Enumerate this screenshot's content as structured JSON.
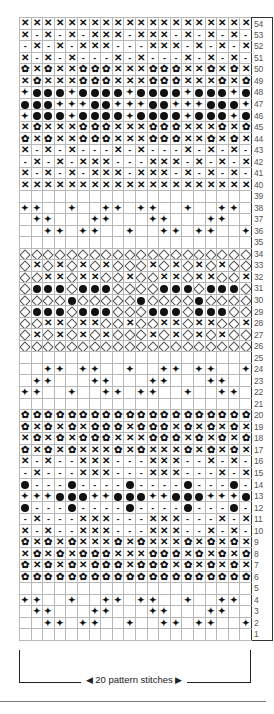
{
  "chart": {
    "columns": 20,
    "rows_count": 54,
    "legend_map": {
      "X": "cross",
      "-": "dash",
      "f": "flower",
      "d": "dot",
      "p": "diamond-star",
      "o": "open-diamond",
      " ": "blank"
    },
    "rows": [
      {
        "n": "54",
        "cells": "XXXXXXXXXXXXXXXXXXXX"
      },
      {
        "n": "53",
        "cells": "X-X-X-XXX-XXX-X-X-X-"
      },
      {
        "n": "52",
        "cells": "-X-X-XXX---XXX-X-X-X"
      },
      {
        "n": "51",
        "cells": "X-X-X---X-X---X-X-X-"
      },
      {
        "n": "50",
        "cells": "fXfXXfffXXXfffXXfXfX"
      },
      {
        "n": "49",
        "cells": "XfXXXfffXXXfffXXXfXf"
      },
      {
        "n": "48",
        "cells": "pdddpddddpddddpdddpd"
      },
      {
        "n": "47",
        "cells": "dddpppddpppddpppdddp"
      },
      {
        "n": "46",
        "cells": "pdddpddddpddddpdddpd"
      },
      {
        "n": "45",
        "cells": "XfXXXfffXXXfffXXXfXf"
      },
      {
        "n": "44",
        "cells": "fXfXXfffXXXfffXXfXfX"
      },
      {
        "n": "43",
        "cells": "X-X-X---X-X---X-X-X-"
      },
      {
        "n": "42",
        "cells": "-X-X-XXX---XXX-X-X-X"
      },
      {
        "n": "41",
        "cells": "X-X-X-XXX-XXX-X-X-X-"
      },
      {
        "n": "40",
        "cells": "XXXXXXXXXXXXXXXXXXXX"
      },
      {
        "n": "39",
        "cells": "                    "
      },
      {
        "n": "38",
        "cells": "pp  p  pp pp  p  pp "
      },
      {
        "n": "37",
        "cells": " pp   pp   pp   pp  "
      },
      {
        "n": "36",
        "cells": "  pp pp  p  pp pp  p"
      },
      {
        "n": "35",
        "cells": "                    "
      },
      {
        "n": "34",
        "cells": "oooooooooooooooooooo"
      },
      {
        "n": "33",
        "cells": "oXoXoXoXoooXoXoXoXoo"
      },
      {
        "n": "32",
        "cells": "ooXXoXXooXooXXoXXooX"
      },
      {
        "n": "31",
        "cells": "odddodddoooodddoddd oo"
      },
      {
        "n": "30",
        "cells": "oooodooooodoooodooood"
      },
      {
        "n": "29",
        "cells": "odddodddooodddodddoo"
      },
      {
        "n": "28",
        "cells": "ooXXoXXooXooXXoXXooX"
      },
      {
        "n": "27",
        "cells": "oXoXoXoXoooXoXoXoXoo"
      },
      {
        "n": "26",
        "cells": "oooooooooooooooooooo"
      },
      {
        "n": "25",
        "cells": "                    "
      },
      {
        "n": "24",
        "cells": "  pp pp  p  pp pp  p"
      },
      {
        "n": "23",
        "cells": " pp   pp   pp   pp  "
      },
      {
        "n": "22",
        "cells": "pp  p  pp pp  p  pp "
      },
      {
        "n": "21",
        "cells": "                    "
      },
      {
        "n": "20",
        "cells": "ffffffffffffffffffff"
      },
      {
        "n": "19",
        "cells": "fXfXfXfffXfffXfXfXfX"
      },
      {
        "n": "18",
        "cells": "XfXfXfffXXXfffXfXfXf"
      },
      {
        "n": "17",
        "cells": "fXfXfXXXfXfXXXfXfXfX"
      },
      {
        "n": "16",
        "cells": "X-X--XXX---XXX--X-X-"
      },
      {
        "n": "15",
        "cells": "-X---XXX---XXX---X-X"
      },
      {
        "n": "14",
        "cells": "d---d----d----d---d-"
      },
      {
        "n": "13",
        "cells": "pppdddppdddppdddpppd"
      },
      {
        "n": "12",
        "cells": "d---d----d----d---d-"
      },
      {
        "n": "11",
        "cells": "-X---XXX---XXX---X-X"
      },
      {
        "n": "10",
        "cells": "X-X--XXX---XXX--X-X-"
      },
      {
        "n": "9",
        "cells": "fXfXfXXXfXfXXXfXfXfX"
      },
      {
        "n": "8",
        "cells": "XfXfXfffXXXfffXfXfXf"
      },
      {
        "n": "7",
        "cells": "fXfXfXfffXfffXfXfXfX"
      },
      {
        "n": "6",
        "cells": "ffffffffffffffffffff"
      },
      {
        "n": "5",
        "cells": "                    "
      },
      {
        "n": "4",
        "cells": "pp  p  pp pp  p  pp "
      },
      {
        "n": "3",
        "cells": " pp   pp   pp   pp  "
      },
      {
        "n": "2",
        "cells": "  pp pp  p  pp pp  p"
      },
      {
        "n": "1",
        "cells": "                    "
      }
    ]
  },
  "footer": {
    "repeat_label": "20 pattern stitches",
    "left_arrow": "◀",
    "right_arrow": "▶"
  },
  "colors": {
    "symbol": "#111111",
    "grid_line": "#b8b8b8",
    "row_number": "#555555"
  }
}
